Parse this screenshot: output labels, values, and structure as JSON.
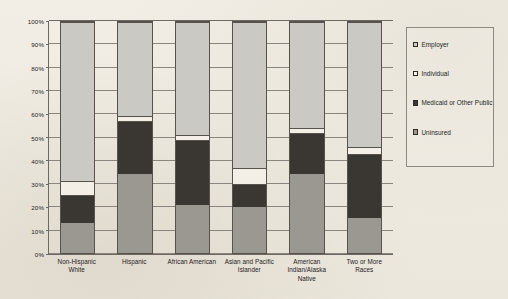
{
  "chart_data": {
    "type": "bar",
    "subtype": "100% stacked bar",
    "title": "",
    "xlabel": "",
    "ylabel": "",
    "ylim": [
      0,
      100
    ],
    "grid": true,
    "legend_position": "right",
    "categories": [
      "Non-Hispanic White",
      "Hispanic",
      "African American",
      "Asian and Pacific Islander",
      "American Indian/Alaska Native",
      "Two or More Races"
    ],
    "category_lines": [
      [
        "Non-Hispanic",
        "White"
      ],
      [
        "Hispanic"
      ],
      [
        "African American"
      ],
      [
        "Asian and Pacific",
        "Islander"
      ],
      [
        "American",
        "Indian/Alaska",
        "Native"
      ],
      [
        "Two or More",
        "Races"
      ]
    ],
    "ytick_labels": [
      "0%",
      "10%",
      "20%",
      "30%",
      "40%",
      "50%",
      "60%",
      "70%",
      "80%",
      "90%",
      "100%"
    ],
    "ytick_values": [
      0,
      10,
      20,
      30,
      40,
      50,
      60,
      70,
      80,
      90,
      100
    ],
    "series": [
      {
        "name": "Uninsured",
        "color": "#9b9791",
        "values": [
          13,
          34,
          21,
          20,
          34,
          15
        ]
      },
      {
        "name": "Medicaid or Other Public",
        "color": "#3a3733",
        "values": [
          12,
          23,
          28,
          10,
          18,
          28
        ]
      },
      {
        "name": "Individual",
        "color": "#f3eee6",
        "values": [
          6,
          2.5,
          2,
          7,
          2,
          3
        ]
      },
      {
        "name": "Employer",
        "color": "#cbc9c4",
        "values": [
          69,
          40.5,
          49,
          63,
          46,
          54
        ]
      }
    ],
    "stack_order_bottom_to_top": [
      "Uninsured",
      "Medicaid or Other Public",
      "Individual",
      "Employer"
    ]
  },
  "legend": {
    "items": [
      {
        "label": "Employer",
        "color": "#cbc9c4"
      },
      {
        "label": "Individual",
        "color": "#f6f3ec"
      },
      {
        "label": "Medicaid or Other Public",
        "color": "#3a3733"
      },
      {
        "label": "Uninsured",
        "color": "#9b9791"
      }
    ]
  }
}
